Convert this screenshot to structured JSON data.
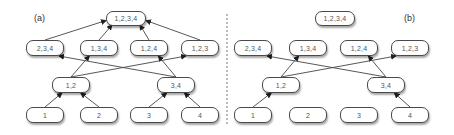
{
  "figure": {
    "divider": {
      "x": 227,
      "style": "dashed",
      "color": "#777777"
    },
    "panels": [
      {
        "label": "(a)",
        "label_pos": [
          34,
          13
        ],
        "nodes": [
          {
            "id": "1234",
            "label": "1,2,3,4",
            "x": 106,
            "y": 11,
            "w": 40,
            "h": 15
          },
          {
            "id": "234",
            "label": "2,3,4",
            "x": 26,
            "y": 40,
            "w": 38,
            "h": 16
          },
          {
            "id": "134",
            "label": "1,3,4",
            "x": 80,
            "y": 40,
            "w": 38,
            "h": 16
          },
          {
            "id": "124",
            "label": "1,2,4",
            "x": 130,
            "y": 40,
            "w": 38,
            "h": 16
          },
          {
            "id": "123",
            "label": "1,2,3",
            "x": 181,
            "y": 40,
            "w": 38,
            "h": 16
          },
          {
            "id": "12",
            "label": "1,2",
            "x": 52,
            "y": 77,
            "w": 38,
            "h": 16
          },
          {
            "id": "34",
            "label": "3,4",
            "x": 157,
            "y": 77,
            "w": 38,
            "h": 16
          },
          {
            "id": "1",
            "label": "1",
            "x": 26,
            "y": 107,
            "w": 38,
            "h": 16
          },
          {
            "id": "2",
            "label": "2",
            "x": 80,
            "y": 107,
            "w": 38,
            "h": 16
          },
          {
            "id": "3",
            "label": "3",
            "x": 130,
            "y": 107,
            "w": 38,
            "h": 16
          },
          {
            "id": "4",
            "label": "4",
            "x": 181,
            "y": 107,
            "w": 38,
            "h": 16
          }
        ],
        "edges": [
          {
            "from": "1",
            "to": "12"
          },
          {
            "from": "2",
            "to": "12"
          },
          {
            "from": "3",
            "to": "34"
          },
          {
            "from": "4",
            "to": "34"
          },
          {
            "from": "12",
            "to": "134"
          },
          {
            "from": "12",
            "to": "123"
          },
          {
            "from": "34",
            "to": "234"
          },
          {
            "from": "34",
            "to": "124"
          },
          {
            "from": "234",
            "to": "1234"
          },
          {
            "from": "134",
            "to": "1234"
          },
          {
            "from": "124",
            "to": "1234"
          },
          {
            "from": "123",
            "to": "1234"
          }
        ]
      },
      {
        "label": "(b)",
        "label_pos": [
          404,
          13
        ],
        "nodes": [
          {
            "id": "1234",
            "label": "1,2,3,4",
            "x": 315,
            "y": 11,
            "w": 40,
            "h": 15
          },
          {
            "id": "234",
            "label": "2,3,4",
            "x": 234,
            "y": 40,
            "w": 38,
            "h": 16
          },
          {
            "id": "134",
            "label": "1,3,4",
            "x": 289,
            "y": 40,
            "w": 38,
            "h": 16
          },
          {
            "id": "124",
            "label": "1,2,4",
            "x": 340,
            "y": 40,
            "w": 38,
            "h": 16
          },
          {
            "id": "123",
            "label": "1,2,3",
            "x": 391,
            "y": 40,
            "w": 38,
            "h": 16
          },
          {
            "id": "12",
            "label": "1,2",
            "x": 262,
            "y": 77,
            "w": 38,
            "h": 16
          },
          {
            "id": "34",
            "label": "3,4",
            "x": 367,
            "y": 77,
            "w": 38,
            "h": 16
          },
          {
            "id": "1",
            "label": "1",
            "x": 234,
            "y": 107,
            "w": 38,
            "h": 16
          },
          {
            "id": "2",
            "label": "2",
            "x": 289,
            "y": 107,
            "w": 38,
            "h": 16
          },
          {
            "id": "3",
            "label": "3",
            "x": 340,
            "y": 107,
            "w": 38,
            "h": 16
          },
          {
            "id": "4",
            "label": "4",
            "x": 391,
            "y": 107,
            "w": 38,
            "h": 16
          }
        ],
        "edges": [
          {
            "from": "1",
            "to": "12"
          },
          {
            "from": "4",
            "to": "34"
          },
          {
            "from": "12",
            "to": "134"
          },
          {
            "from": "12",
            "to": "123"
          },
          {
            "from": "34",
            "to": "234"
          },
          {
            "from": "34",
            "to": "124"
          }
        ]
      }
    ]
  }
}
